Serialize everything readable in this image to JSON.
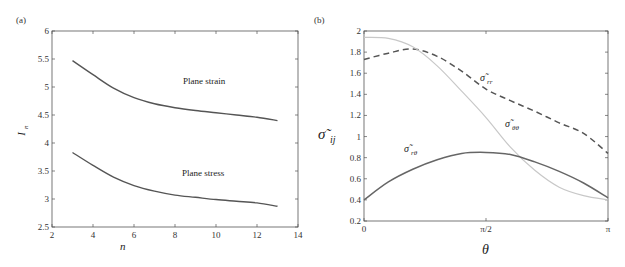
{
  "chart_data": [
    {
      "panel_label": "(a)",
      "type": "line",
      "title": "",
      "xlabel": "n",
      "ylabel": "I_n",
      "xlim": [
        2,
        14
      ],
      "ylim": [
        2.5,
        6
      ],
      "xticks": [
        "2",
        "4",
        "6",
        "8",
        "10",
        "12",
        "14"
      ],
      "yticks": [
        "2.5",
        "3",
        "3.5",
        "4",
        "4.5",
        "5",
        "5.5",
        "6"
      ],
      "grid": false,
      "legend": "inline annotations",
      "x": [
        3,
        4,
        5,
        6,
        7,
        8,
        9,
        10,
        11,
        12,
        13
      ],
      "series": [
        {
          "name": "Plane strain",
          "values": [
            5.47,
            5.22,
            4.98,
            4.81,
            4.7,
            4.63,
            4.58,
            4.54,
            4.5,
            4.46,
            4.4
          ]
        },
        {
          "name": "Plane stress",
          "values": [
            3.83,
            3.6,
            3.39,
            3.24,
            3.14,
            3.07,
            3.03,
            2.99,
            2.96,
            2.93,
            2.87
          ]
        }
      ],
      "annotations": [
        "Plane strain",
        "Plane stress"
      ]
    },
    {
      "panel_label": "(b)",
      "type": "line",
      "title": "",
      "xlabel": "θ",
      "ylabel": "σ̃_ij",
      "xlim": [
        0,
        3.1416
      ],
      "ylim": [
        0.2,
        2
      ],
      "xticks": [
        "0",
        "π/2",
        "π"
      ],
      "yticks": [
        "0.2",
        "0.4",
        "0.6",
        "0.8",
        "1",
        "1.2",
        "1.4",
        "1.6",
        "1.8",
        "2"
      ],
      "grid": false,
      "legend": "inline annotations",
      "x": [
        0,
        0.314,
        0.628,
        0.942,
        1.257,
        1.571,
        1.885,
        2.199,
        2.513,
        2.827,
        3.1416
      ],
      "series": [
        {
          "name": "σ̃_rr",
          "style": "dashed",
          "values": [
            1.73,
            1.79,
            1.83,
            1.76,
            1.62,
            1.45,
            1.34,
            1.24,
            1.13,
            1.03,
            0.84
          ]
        },
        {
          "name": "σ̃_θθ",
          "style": "dotted-light",
          "values": [
            1.94,
            1.93,
            1.85,
            1.67,
            1.43,
            1.18,
            0.9,
            0.68,
            0.52,
            0.44,
            0.4
          ]
        },
        {
          "name": "σ̃_rθ",
          "style": "solid",
          "values": [
            0.4,
            0.57,
            0.69,
            0.78,
            0.84,
            0.85,
            0.83,
            0.76,
            0.67,
            0.56,
            0.42
          ]
        }
      ],
      "annotations": [
        "σ̃_rr",
        "σ̃_θθ",
        "σ̃_rθ"
      ]
    }
  ],
  "labels": {
    "a": {
      "panel": "(a)",
      "xlabel": "n",
      "ylabel_main": "I",
      "ylabel_sub": "n",
      "ann1": "Plane strain",
      "ann2": "Plane stress"
    },
    "b": {
      "panel": "(b)",
      "xlabel": "θ",
      "ylabel_main": "σ̃",
      "ylabel_sub": "ij",
      "rr_main": "σ̃",
      "rr_sub": "rr",
      "tt_main": "σ̃",
      "tt_sub": "θθ",
      "rt_main": "σ̃",
      "rt_sub": "rθ"
    }
  }
}
